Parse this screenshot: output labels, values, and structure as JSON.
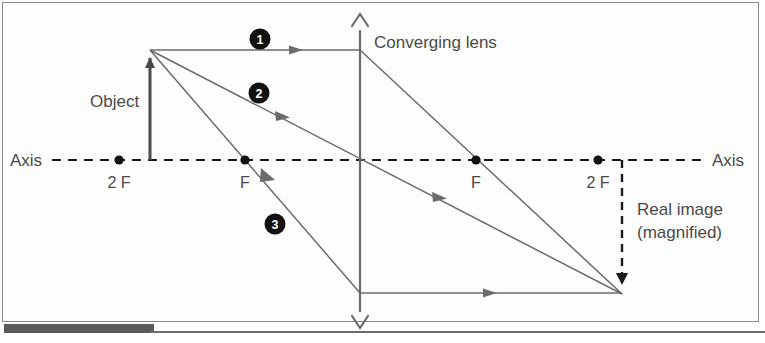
{
  "figure": {
    "labels": {
      "lens": "Converging lens",
      "object": "Object",
      "axis_left": "Axis",
      "axis_right": "Axis",
      "focal_2f_left": "2 F",
      "focal_f_left": "F",
      "focal_f_right": "F",
      "focal_2f_right": "2 F",
      "image_line1": "Real image",
      "image_line2": "(magnified)"
    },
    "ray_markers": [
      {
        "id": "ray-1",
        "label": "1"
      },
      {
        "id": "ray-2",
        "label": "2"
      },
      {
        "id": "ray-3",
        "label": "3"
      }
    ],
    "colors": {
      "ray": "#6b6b6b",
      "axis": "#1a1a1a",
      "object": "#4a4a4a",
      "text": "#4a4a4a",
      "marker_fill": "#111111",
      "frame": "#8a8a8a",
      "bottom_bar": "#5a5a5a",
      "background": "#ffffff"
    },
    "geometry": {
      "axis_y": 160,
      "lens_x": 360,
      "object_tip": {
        "x": 150,
        "y": 52
      },
      "object_base": {
        "x": 150,
        "y": 160
      },
      "image_tip": {
        "x": 622,
        "y": 294
      },
      "image_base": {
        "x": 622,
        "y": 160
      },
      "focal_points": [
        {
          "name": "2 F",
          "x": 119,
          "y": 160
        },
        {
          "name": "F",
          "x": 245,
          "y": 160
        },
        {
          "name": "F",
          "x": 476,
          "y": 160
        },
        {
          "name": "2 F",
          "x": 598,
          "y": 160
        }
      ]
    }
  }
}
